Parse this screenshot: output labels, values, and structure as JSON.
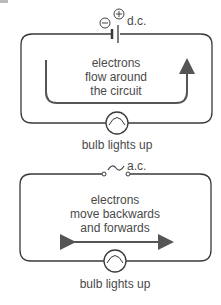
{
  "dc_circuit": {
    "supply_label": "d.c.",
    "negative_symbol": "−",
    "positive_symbol": "+",
    "description": [
      "electrons",
      "flow around",
      "the circuit"
    ],
    "bulb_label": "bulb lights up"
  },
  "ac_circuit": {
    "supply_label": "a.c.",
    "supply_symbol": "~",
    "description": [
      "electrons",
      "move backwards",
      "and forwards"
    ],
    "bulb_label": "bulb lights up"
  },
  "colors": {
    "wire": "#3a3a3a",
    "arrow": "#555555",
    "text": "#4a4a4a"
  }
}
